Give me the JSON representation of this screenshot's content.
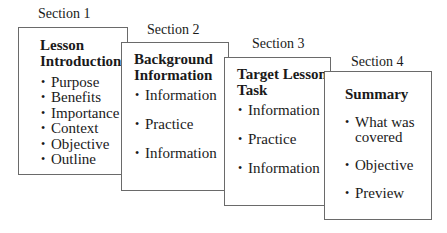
{
  "diagram": {
    "type": "overlapping-cards-sequence",
    "bullet_glyph": "•",
    "colors": {
      "background": "#ffffff",
      "border": "#6a6a6a",
      "text": "#1a1a1a"
    },
    "sections": [
      {
        "label": "Section 1",
        "title": "Lesson Introduction",
        "items": [
          "Purpose",
          "Benefits",
          "Importance",
          "Context",
          "Objective",
          "Outline"
        ]
      },
      {
        "label": "Section 2",
        "title": "Background Information",
        "items": [
          "Information",
          "Practice",
          "Information"
        ]
      },
      {
        "label": "Section 3",
        "title": "Target Lesson Task",
        "items": [
          "Information",
          "Practice",
          "Information"
        ]
      },
      {
        "label": "Section 4",
        "title": "Summary",
        "items": [
          "What was covered",
          "Objective",
          "Preview"
        ]
      }
    ]
  }
}
